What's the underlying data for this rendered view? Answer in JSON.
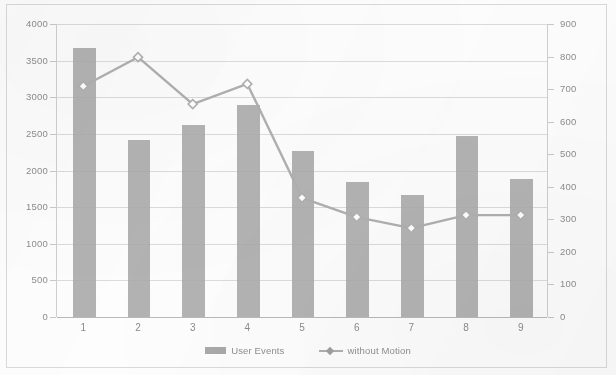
{
  "chart_data": {
    "type": "bar",
    "title": "",
    "subtitle": "",
    "xlabel": "",
    "ylabel": "",
    "categories": [
      "1",
      "2",
      "3",
      "4",
      "5",
      "6",
      "7",
      "8",
      "9"
    ],
    "grid": true,
    "legend_position": "bottom",
    "primary_axis": {
      "name": "left",
      "min": 0,
      "max": 4000,
      "step": 500,
      "ticks": [
        "0",
        "500",
        "1000",
        "1500",
        "2000",
        "2500",
        "3000",
        "3500",
        "4000"
      ]
    },
    "secondary_axis": {
      "name": "right",
      "min": 0,
      "max": 900,
      "step": 100,
      "ticks": [
        "0",
        "100",
        "200",
        "300",
        "400",
        "500",
        "600",
        "700",
        "800",
        "900"
      ]
    },
    "series": [
      {
        "name": "User Events",
        "type": "bar",
        "axis": "primary",
        "color": "#a9a9a9",
        "values": [
          3670,
          2420,
          2620,
          2900,
          2270,
          1850,
          1670,
          2470,
          1880
        ]
      },
      {
        "name": "without Motion",
        "type": "line",
        "axis": "secondary",
        "color": "#b0b0b0",
        "marker": "diamond",
        "values": [
          709,
          798,
          654,
          716,
          366,
          307,
          273,
          313,
          313
        ]
      }
    ]
  },
  "legend": {
    "entries": [
      {
        "label": "User Events",
        "marker": "bar-swatch"
      },
      {
        "label": "without Motion",
        "marker": "line-diamond-swatch"
      }
    ]
  }
}
